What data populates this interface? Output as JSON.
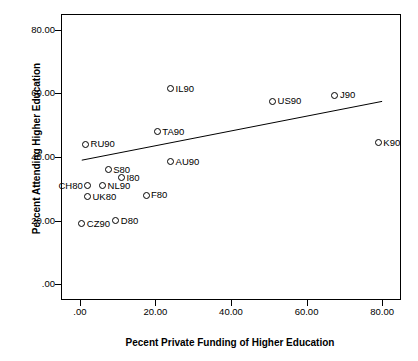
{
  "chart_data": {
    "type": "scatter",
    "title": "",
    "xlabel": "Pecent Private Funding of Higher Education",
    "ylabel": "Percent Attending Higher Education",
    "xlim": [
      -5.0,
      85.0
    ],
    "ylim": [
      -5.0,
      85.0
    ],
    "xticks": [
      0.0,
      20.0,
      40.0,
      60.0,
      80.0
    ],
    "xtick_labels": [
      ".00",
      "20.00",
      "40.00",
      "60.00",
      "80.00"
    ],
    "yticks": [
      0.0,
      20.0,
      40.0,
      60.0,
      80.0
    ],
    "ytick_labels": [
      ".00",
      "20.00",
      "40.00",
      "60.00",
      "80.00"
    ],
    "grid": false,
    "legend": "none",
    "marker": "open-circle",
    "trendline": {
      "visible": true,
      "x_start": 0.5,
      "y_start": 39.0,
      "x_end": 80.0,
      "y_end": 57.5
    },
    "points": [
      {
        "label": "IL90",
        "x": 24.0,
        "y": 61.5,
        "label_side": "right"
      },
      {
        "label": "US90",
        "x": 51.0,
        "y": 57.5,
        "label_side": "right"
      },
      {
        "label": "J90",
        "x": 67.5,
        "y": 59.5,
        "label_side": "right"
      },
      {
        "label": "TA90",
        "x": 20.5,
        "y": 48.0,
        "label_side": "right"
      },
      {
        "label": "K90",
        "x": 79.0,
        "y": 44.5,
        "label_side": "right"
      },
      {
        "label": "RU90",
        "x": 1.5,
        "y": 44.0,
        "label_side": "right"
      },
      {
        "label": "S80",
        "x": 7.5,
        "y": 36.0,
        "label_side": "right"
      },
      {
        "label": "AU90",
        "x": 24.0,
        "y": 38.5,
        "label_side": "right"
      },
      {
        "label": "I80",
        "x": 11.0,
        "y": 33.5,
        "label_side": "right"
      },
      {
        "label": "NL90",
        "x": 6.0,
        "y": 31.0,
        "label_side": "right"
      },
      {
        "label": "CH80",
        "x": 2.0,
        "y": 31.0,
        "label_side": "left"
      },
      {
        "label": "UK80",
        "x": 2.0,
        "y": 27.5,
        "label_side": "right"
      },
      {
        "label": "F80",
        "x": 17.5,
        "y": 28.0,
        "label_side": "right"
      },
      {
        "label": "CZ90",
        "x": 0.5,
        "y": 19.0,
        "label_side": "right"
      },
      {
        "label": "D80",
        "x": 9.5,
        "y": 20.0,
        "label_side": "right"
      }
    ]
  }
}
